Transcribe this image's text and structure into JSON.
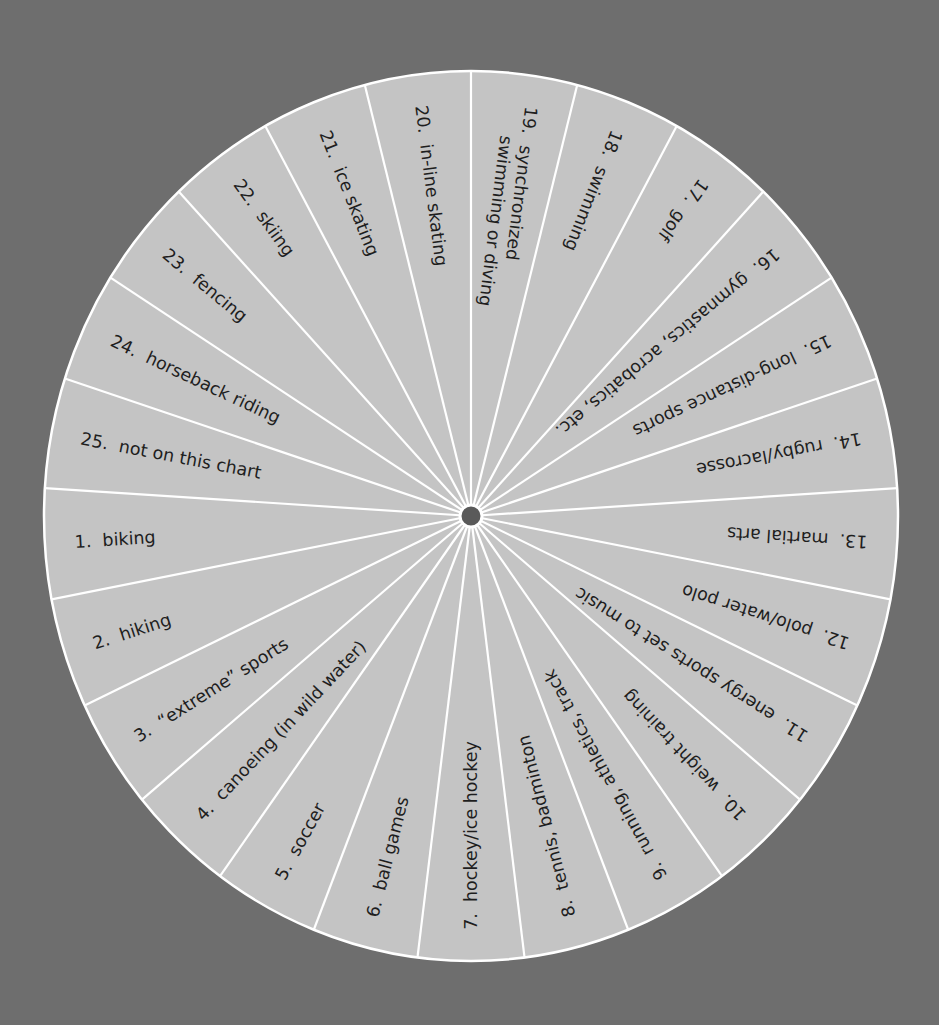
{
  "colors": {
    "background": "#6e6e6e",
    "wedge_fill": "#c4c4c4",
    "divider": "#ffffff",
    "hub": "#5a5a5a",
    "text": "#1e1e1e"
  },
  "wheel": {
    "center": [
      471,
      516
    ],
    "radius_x": 427,
    "radius_y": 445,
    "hub_radius": 11,
    "segment_count": 25,
    "start_boundary_deg": -90,
    "segments_clockwise_from_top": [
      {
        "number": "19.",
        "lines": [
          "synchronized",
          "swimming or diving"
        ]
      },
      {
        "number": "18.",
        "lines": [
          "swimming"
        ]
      },
      {
        "number": "17.",
        "lines": [
          "golf"
        ]
      },
      {
        "number": "16.",
        "lines": [
          "gymnastics, acrobatics, etc."
        ]
      },
      {
        "number": "15.",
        "lines": [
          "long-distance sports"
        ]
      },
      {
        "number": "14.",
        "lines": [
          "rugby/lacrosse"
        ]
      },
      {
        "number": "13.",
        "lines": [
          "martial arts"
        ]
      },
      {
        "number": "12.",
        "lines": [
          "polo/water polo"
        ]
      },
      {
        "number": "11.",
        "lines": [
          "energy sports set to music"
        ]
      },
      {
        "number": "10.",
        "lines": [
          "weight training"
        ]
      },
      {
        "number": "9.",
        "lines": [
          "running, athletics, track"
        ]
      },
      {
        "number": "8.",
        "lines": [
          "tennis, badminton"
        ]
      },
      {
        "number": "7.",
        "lines": [
          "hockey/ice hockey"
        ]
      },
      {
        "number": "6.",
        "lines": [
          "ball games"
        ]
      },
      {
        "number": "5.",
        "lines": [
          "soccer"
        ]
      },
      {
        "number": "4.",
        "lines": [
          "canoeing (in wild water)"
        ]
      },
      {
        "number": "3.",
        "lines": [
          "“extreme” sports"
        ]
      },
      {
        "number": "2.",
        "lines": [
          "hiking"
        ]
      },
      {
        "number": "1.",
        "lines": [
          "biking"
        ]
      },
      {
        "number": "25.",
        "lines": [
          "not on this chart"
        ]
      },
      {
        "number": "24.",
        "lines": [
          "horseback riding"
        ]
      },
      {
        "number": "23.",
        "lines": [
          "fencing"
        ]
      },
      {
        "number": "22.",
        "lines": [
          "skiing"
        ]
      },
      {
        "number": "21.",
        "lines": [
          "ice skating"
        ]
      },
      {
        "number": "20.",
        "lines": [
          "in-line skating"
        ]
      }
    ]
  }
}
